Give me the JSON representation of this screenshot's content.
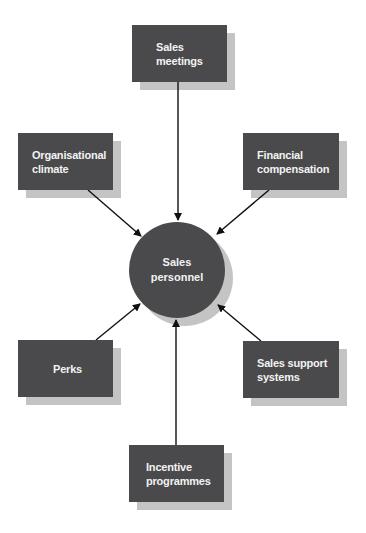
{
  "diagram": {
    "type": "hub-and-spoke",
    "center": {
      "label": "Sales\npersonnel"
    },
    "nodes": [
      {
        "id": "sales-meetings",
        "label": "Sales\nmeetings"
      },
      {
        "id": "organisational-climate",
        "label": "Organisational\nclimate"
      },
      {
        "id": "financial-compensation",
        "label": "Financial\ncompensation"
      },
      {
        "id": "perks",
        "label": "Perks"
      },
      {
        "id": "sales-support-systems",
        "label": "Sales support\nsystems"
      },
      {
        "id": "incentive-programmes",
        "label": "Incentive\nprogrammes"
      }
    ],
    "edges": [
      {
        "from": "sales-meetings",
        "to": "center"
      },
      {
        "from": "organisational-climate",
        "to": "center"
      },
      {
        "from": "financial-compensation",
        "to": "center"
      },
      {
        "from": "perks",
        "to": "center"
      },
      {
        "from": "sales-support-systems",
        "to": "center"
      },
      {
        "from": "incentive-programmes",
        "to": "center"
      }
    ],
    "colors": {
      "node_fill": "#4a4a4c",
      "shadow": "#c4c4c4",
      "text": "#f2f2f2",
      "arrow": "#111111"
    }
  }
}
